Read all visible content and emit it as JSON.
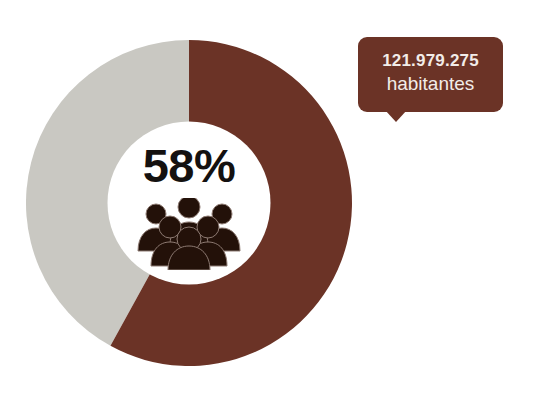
{
  "chart_data": {
    "type": "pie",
    "title": "",
    "subtitle": "",
    "xlabel": "",
    "ylabel": "",
    "grid": false,
    "legend_position": "none",
    "donut": true,
    "inner_radius_ratio": 0.5,
    "start_angle_deg": 0,
    "direction": "clockwise",
    "categories": [
      "Poblacion urbana",
      "Resto"
    ],
    "values": [
      58,
      42
    ],
    "units": "%",
    "colors": [
      "#6b3326",
      "#c9c8c2"
    ],
    "center_label": {
      "value": "58%",
      "icon": "people-group-icon"
    },
    "annotations": [
      {
        "number": "121.979.275",
        "unit": "habitantes",
        "background": "#6b3326",
        "text_color": "#f2ece8",
        "points_to": "brown-segment"
      }
    ]
  },
  "colors": {
    "brown": "#6b3326",
    "gray": "#c9c8c2",
    "white": "#ffffff",
    "text_dark": "#141110",
    "callout_text": "#f2ece8"
  },
  "donut": {
    "segment_primary_label": "58%",
    "segment_primary_color": "#6b3326",
    "segment_secondary_color": "#c9c8c2"
  },
  "center": {
    "percentage": "58%",
    "icon_name": "people-group-icon"
  },
  "callout": {
    "number": "121.979.275",
    "unit": "habitantes"
  }
}
